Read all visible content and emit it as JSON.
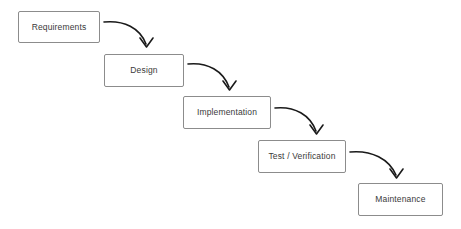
{
  "diagram": {
    "type": "process-flow",
    "background_color": "#ffffff",
    "box_border_color": "#8c8c8c",
    "box_fill_color": "#ffffff",
    "text_color": "#3a3a3a",
    "arrow_color": "#1a1a1a",
    "stages": [
      {
        "id": "requirements",
        "label": "Requirements",
        "x": 18,
        "y": 11,
        "width": 82,
        "height": 32
      },
      {
        "id": "design",
        "label": "Design",
        "x": 104,
        "y": 54,
        "width": 80,
        "height": 33
      },
      {
        "id": "implementation",
        "label": "Implementation",
        "x": 183,
        "y": 96,
        "width": 88,
        "height": 33
      },
      {
        "id": "test-verification",
        "label": "Test / Verification",
        "x": 258,
        "y": 140,
        "width": 88,
        "height": 33
      },
      {
        "id": "maintenance",
        "label": "Maintenance",
        "x": 358,
        "y": 183,
        "width": 85,
        "height": 33
      }
    ],
    "connectors": [
      {
        "id": "requirements-to-design",
        "from": "requirements",
        "to": "design",
        "path": "M 104 22 C 124 20, 140 28, 146 44",
        "arrowhead": "M 140 38 L 146.5 47 L 153 38"
      },
      {
        "id": "design-to-implementation",
        "from": "design",
        "to": "implementation",
        "path": "M 188 64 C 208 62, 223 71, 229 87",
        "arrowhead": "M 223 81 L 229.5 90 L 236 81"
      },
      {
        "id": "implementation-to-test",
        "from": "implementation",
        "to": "test-verification",
        "path": "M 275 108 C 295 106, 310 115, 316 131",
        "arrowhead": "M 310 125 L 316.5 134 L 323 125"
      },
      {
        "id": "test-to-maintenance",
        "from": "test-verification",
        "to": "maintenance",
        "path": "M 350 152 C 372 150, 389 159, 396 175",
        "arrowhead": "M 390 169 L 396.5 178 L 403 169"
      }
    ]
  }
}
